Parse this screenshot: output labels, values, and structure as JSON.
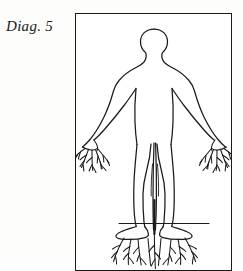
{
  "page": {
    "background_color": "#fdfdfc",
    "width": 243,
    "height": 264
  },
  "caption": {
    "text": "Diag. 5",
    "style": "italic-serif",
    "color": "#1a1a1a"
  },
  "frame": {
    "name": "figure-border",
    "stroke_color": "#1a1a1a",
    "fill_color": "#ffffff",
    "x": 75,
    "y": 13,
    "width": 157,
    "height": 258,
    "cropped_at_bottom": true
  },
  "illustration": {
    "title": "Diag. 5",
    "description": "Line drawing of a standing human figure, arms lowered and spread outward, whose hands and feet terminate in branching plant roots; a horizontal ground line crosses at the ankles with roots descending below it.",
    "line_color": "#1a1a1a",
    "fill_color": "none",
    "stroke_width": 1.2,
    "elements": [
      {
        "name": "head",
        "label": "Head",
        "shape": "oval"
      },
      {
        "name": "neck",
        "label": "Neck",
        "shape": "tapered"
      },
      {
        "name": "torso",
        "label": "Torso",
        "shape": "silhouette"
      },
      {
        "name": "left-arm",
        "label": "Left arm",
        "shape": "tapered-limb"
      },
      {
        "name": "right-arm",
        "label": "Right arm",
        "shape": "tapered-limb"
      },
      {
        "name": "left-hand-roots",
        "label": "Left hand roots",
        "shape": "branching-roots"
      },
      {
        "name": "right-hand-roots",
        "label": "Right hand roots",
        "shape": "branching-roots"
      },
      {
        "name": "left-leg",
        "label": "Left leg",
        "shape": "tapered-limb"
      },
      {
        "name": "right-leg",
        "label": "Right leg",
        "shape": "tapered-limb"
      },
      {
        "name": "ground-line",
        "label": "Ground line",
        "shape": "horizontal-line"
      },
      {
        "name": "foot-roots",
        "label": "Foot roots",
        "shape": "branching-roots"
      }
    ]
  }
}
